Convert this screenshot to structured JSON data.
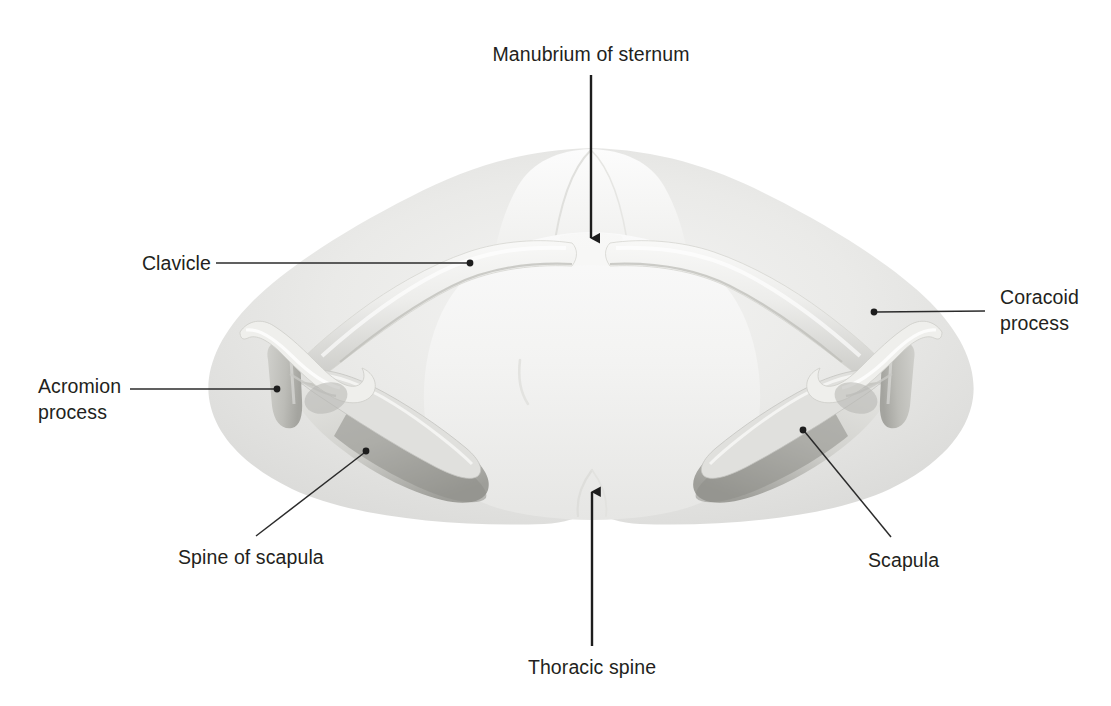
{
  "figure": {
    "background_color": "#ffffff",
    "label_color": "#231f20",
    "leader_color": "#2b2b2b",
    "bone_light": "#f2f2f0",
    "bone_mid": "#d9d9d6",
    "bone_shadow": "#a8a8a4",
    "body_silhouette": "#e2e2e0",
    "body_silhouette_light": "#f0f0ee"
  },
  "labels": [
    {
      "id": "manubrium-of-sternum",
      "text": "Manubrium of sternum",
      "align": "center",
      "x": 591,
      "y": 45,
      "connector": "arrow-down"
    },
    {
      "id": "clavicle",
      "text": "Clavicle",
      "align": "right",
      "x": 131,
      "y": 252,
      "connector": "line-horizontal-right"
    },
    {
      "id": "coracoid-process",
      "text": "Coracoid\nprocess",
      "align": "left",
      "x": 1000,
      "y": 286,
      "connector": "line-horizontal-left"
    },
    {
      "id": "acromion-process",
      "text": "Acromion\nprocess",
      "align": "left",
      "x": 38,
      "y": 375,
      "connector": "line-horizontal-right"
    },
    {
      "id": "spine-of-scapula",
      "text": "Spine of scapula",
      "align": "left",
      "x": 178,
      "y": 545,
      "connector": "line-diagonal-up-right"
    },
    {
      "id": "scapula",
      "text": "Scapula",
      "align": "left",
      "x": 868,
      "y": 548,
      "connector": "line-diagonal-up-left"
    },
    {
      "id": "thoracic-spine",
      "text": "Thoracic spine",
      "align": "center",
      "x": 592,
      "y": 655,
      "connector": "arrow-up"
    }
  ],
  "leaders": {
    "manubrium_arrow": {
      "x1": 591,
      "y1": 75,
      "x2": 591,
      "y2": 238
    },
    "clavicle_line": {
      "x1": 216,
      "y1": 263,
      "x2": 470,
      "y2": 263,
      "dot_x": 470,
      "dot_y": 263
    },
    "coracoid_line": {
      "x1": 985,
      "y1": 311,
      "x2": 874,
      "y2": 312,
      "dot_x": 874,
      "dot_y": 312
    },
    "acromion_line": {
      "x1": 130,
      "y1": 389,
      "x2": 277,
      "y2": 389,
      "dot_x": 277,
      "dot_y": 389
    },
    "spine_line": {
      "x1": 256,
      "y1": 536,
      "x2": 366,
      "y2": 451,
      "dot_x": 366,
      "dot_y": 451
    },
    "scapula_line": {
      "x1": 891,
      "y1": 537,
      "x2": 803,
      "y2": 430,
      "dot_x": 803,
      "dot_y": 430
    },
    "thoracic_arrow": {
      "x1": 592,
      "y1": 646,
      "x2": 592,
      "y2": 492
    }
  },
  "anatomy": {
    "structures": [
      "body-silhouette",
      "neck",
      "thorax",
      "left-clavicle",
      "right-clavicle",
      "left-scapula",
      "right-scapula",
      "left-acromion",
      "right-acromion",
      "left-coracoid-process",
      "right-coracoid-process",
      "left-spine-of-scapula",
      "right-spine-of-scapula",
      "manubrium"
    ]
  }
}
